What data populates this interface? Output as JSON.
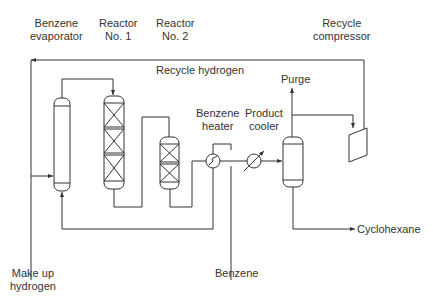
{
  "diagram": {
    "type": "process-flow",
    "equipment": [
      {
        "id": "benzene_evaporator",
        "label_line1": "Benzene",
        "label_line2": "evaporator"
      },
      {
        "id": "reactor1",
        "label_line1": "Reactor",
        "label_line2": "No. 1"
      },
      {
        "id": "reactor2",
        "label_line1": "Reactor",
        "label_line2": "No. 2"
      },
      {
        "id": "recycle_compressor",
        "label_line1": "Recycle",
        "label_line2": "compressor"
      },
      {
        "id": "benzene_heater",
        "label_line1": "Benzene",
        "label_line2": "heater"
      },
      {
        "id": "product_cooler",
        "label_line1": "Product",
        "label_line2": "cooler"
      }
    ],
    "streams": {
      "recycle_hydrogen": "Recycle hydrogen",
      "purge": "Purge",
      "cyclohexane": "Cyclohexane",
      "benzene": "Benzene",
      "makeup_line1": "Make up",
      "makeup_line2": "hydrogen"
    },
    "line_color": "#333333"
  }
}
